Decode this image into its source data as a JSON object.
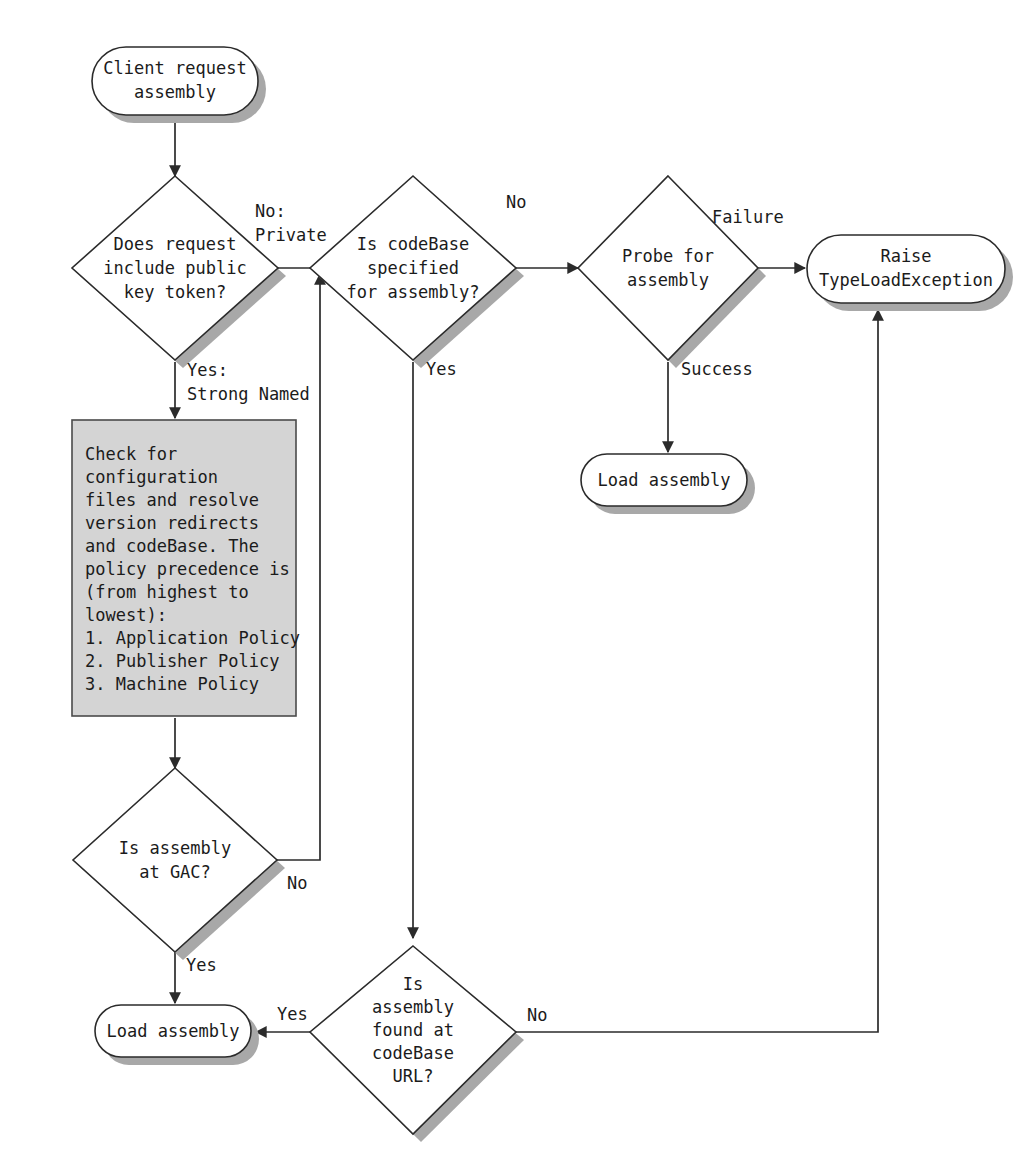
{
  "diagram": {
    "colors": {
      "shape_fill": "#ffffff",
      "shape_stroke": "#2b2b2b",
      "process_fill": "#d4d4d4",
      "shadow": "#a8a8a8",
      "text": "#1b1b1b",
      "background": "#ffffff"
    }
  },
  "nodes": {
    "start": {
      "type": "terminator",
      "lines": [
        "Client request",
        "assembly"
      ]
    },
    "decision_public_key": {
      "type": "decision",
      "lines": [
        "Does request",
        "include public",
        "key token?"
      ]
    },
    "decision_codebase_specified": {
      "type": "decision",
      "lines": [
        "Is codeBase",
        "specified",
        "for assembly?"
      ]
    },
    "decision_probe": {
      "type": "decision",
      "lines": [
        "Probe for",
        "assembly"
      ]
    },
    "raise_exception": {
      "type": "terminator",
      "lines": [
        "Raise",
        "TypeLoadException"
      ]
    },
    "load_assembly_probe": {
      "type": "terminator",
      "lines": [
        "Load assembly"
      ]
    },
    "process_config": {
      "type": "process",
      "lines": [
        "Check for",
        "configuration",
        "files and resolve",
        "version redirects",
        "and codeBase. The",
        "policy precedence is",
        "(from highest to",
        "lowest):",
        "1. Application Policy",
        "2. Publisher Policy",
        "3. Machine Policy"
      ]
    },
    "decision_gac": {
      "type": "decision",
      "lines": [
        "Is assembly",
        "at GAC?"
      ]
    },
    "load_assembly_gac": {
      "type": "terminator",
      "lines": [
        "Load assembly"
      ]
    },
    "decision_codebase_url": {
      "type": "decision",
      "lines": [
        "Is",
        "assembly",
        "found at",
        "codeBase",
        "URL?"
      ]
    }
  },
  "edge_labels": {
    "no_private_line1": "No:",
    "no_private_line2": "Private",
    "yes_strong_line1": "Yes:",
    "yes_strong_line2": "Strong Named",
    "codebase_no": "No",
    "codebase_yes": "Yes",
    "probe_failure": "Failure",
    "probe_success": "Success",
    "gac_no": "No",
    "gac_yes": "Yes",
    "url_yes": "Yes",
    "url_no": "No"
  }
}
